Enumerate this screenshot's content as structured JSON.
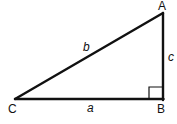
{
  "diagram": {
    "type": "right-triangle",
    "vertices": {
      "A": {
        "label": "A",
        "x": 163,
        "y": 13
      },
      "B": {
        "label": "B",
        "x": 163,
        "y": 99
      },
      "C": {
        "label": "C",
        "x": 15,
        "y": 99
      }
    },
    "sides": {
      "a": {
        "label": "a",
        "from": "C",
        "to": "B"
      },
      "b": {
        "label": "b",
        "from": "C",
        "to": "A"
      },
      "c": {
        "label": "c",
        "from": "B",
        "to": "A"
      }
    },
    "right_angle_at": "B",
    "stroke_color": "#111111",
    "background_color": "#ffffff"
  }
}
